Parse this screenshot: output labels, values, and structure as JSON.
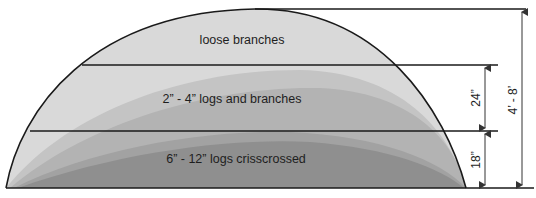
{
  "diagram": {
    "layers": [
      {
        "id": "top",
        "label": "loose branches",
        "color": "#d9d9d9"
      },
      {
        "id": "middle",
        "label": "2” - 4” logs and branches",
        "color": "#b9b9b9"
      },
      {
        "id": "bottom",
        "label": "6” - 12” logs crisscrossed",
        "color": "#8f8f8f"
      }
    ],
    "accent_layers": {
      "inner_light": "#c9c9c9",
      "inner_mid": "#a3a3a3"
    },
    "dimensions": [
      {
        "id": "middle-layer-height",
        "label": "24”"
      },
      {
        "id": "bottom-layer-height",
        "label": "18”"
      },
      {
        "id": "total-height",
        "label": "4’ - 8’"
      }
    ],
    "line_color": "#1a1a1a",
    "arrow_color": "#333333"
  }
}
